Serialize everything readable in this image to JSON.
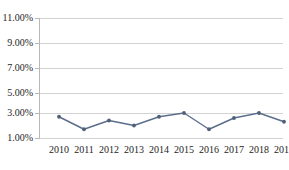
{
  "chart_data": {
    "type": "line",
    "title": "",
    "subtitle": "",
    "xlabel": "",
    "ylabel": "",
    "categories": [
      "2010",
      "2011",
      "2012",
      "2013",
      "2014",
      "2015",
      "2016",
      "2017",
      "2018",
      "2019"
    ],
    "values": [
      2.7,
      1.7,
      2.4,
      2.0,
      2.7,
      3.0,
      1.7,
      2.6,
      3.0,
      2.3
    ],
    "series": [
      {
        "name": "",
        "values": [
          2.7,
          1.7,
          2.4,
          2.0,
          2.7,
          3.0,
          1.7,
          2.6,
          3.0,
          2.3
        ]
      }
    ],
    "ytick_labels": [
      "1.00%",
      "3.00%",
      "5.00%",
      "7.00%",
      "9.00%",
      "11.00%"
    ],
    "ytick_values": [
      1,
      3,
      5,
      7,
      9,
      11
    ],
    "ylim": [
      1,
      11
    ],
    "xlim": [
      "2010",
      "2019"
    ],
    "grid": true,
    "grid_axis": "y",
    "legend": false,
    "legend_position": "none",
    "annotations": [],
    "colors": {
      "line": "#5b6e8c",
      "marker": "#4f6079",
      "gridline": "#d2d2d2",
      "axis": "#b8b8b8",
      "text": "#242424",
      "background": "#ffffff"
    }
  }
}
